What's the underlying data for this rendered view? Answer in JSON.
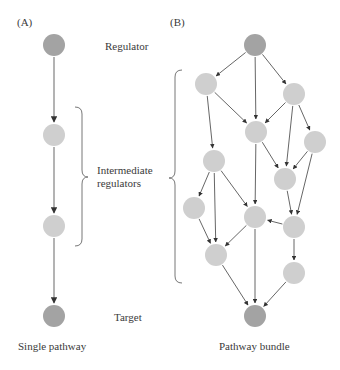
{
  "colors": {
    "endpoint_node": "#a3a3a3",
    "intermediate_node": "#cfcfcf",
    "edge": "#555555",
    "bracket": "#777777",
    "text": "#3a3a3a"
  },
  "panel_a": {
    "label": "(A)",
    "caption": "Single pathway",
    "labels": {
      "regulator": "Regulator",
      "intermediate_line1": "Intermediate",
      "intermediate_line2": "regulators",
      "target": "Target"
    },
    "nodes": [
      {
        "id": "regulator",
        "type": "endpoint",
        "x": 54,
        "y": 45
      },
      {
        "id": "int1",
        "type": "intermediate",
        "x": 54,
        "y": 135
      },
      {
        "id": "int2",
        "type": "intermediate",
        "x": 54,
        "y": 226
      },
      {
        "id": "target",
        "type": "endpoint",
        "x": 54,
        "y": 316
      }
    ],
    "edges": [
      [
        "regulator",
        "int1"
      ],
      [
        "int1",
        "int2"
      ],
      [
        "int2",
        "target"
      ]
    ]
  },
  "panel_b": {
    "label": "(B)",
    "caption": "Pathway bundle",
    "nodes": [
      {
        "id": "top",
        "type": "endpoint",
        "x": 255,
        "y": 45
      },
      {
        "id": "L1",
        "type": "intermediate",
        "x": 206,
        "y": 84
      },
      {
        "id": "R1",
        "type": "intermediate",
        "x": 294,
        "y": 94
      },
      {
        "id": "M1",
        "type": "intermediate",
        "x": 256,
        "y": 132
      },
      {
        "id": "R2",
        "type": "intermediate",
        "x": 315,
        "y": 142
      },
      {
        "id": "L2",
        "type": "intermediate",
        "x": 214,
        "y": 161
      },
      {
        "id": "MR",
        "type": "intermediate",
        "x": 285,
        "y": 179
      },
      {
        "id": "LL",
        "type": "intermediate",
        "x": 194,
        "y": 208
      },
      {
        "id": "M2",
        "type": "intermediate",
        "x": 255,
        "y": 217
      },
      {
        "id": "R3",
        "type": "intermediate",
        "x": 294,
        "y": 227
      },
      {
        "id": "L3",
        "type": "intermediate",
        "x": 216,
        "y": 255
      },
      {
        "id": "R4",
        "type": "intermediate",
        "x": 294,
        "y": 273
      },
      {
        "id": "target",
        "type": "endpoint",
        "x": 255,
        "y": 316
      }
    ],
    "edges": [
      [
        "top",
        "L1"
      ],
      [
        "top",
        "M1"
      ],
      [
        "top",
        "R1"
      ],
      [
        "L1",
        "L2"
      ],
      [
        "L1",
        "M1"
      ],
      [
        "R1",
        "M1"
      ],
      [
        "R1",
        "MR"
      ],
      [
        "R1",
        "R2"
      ],
      [
        "M1",
        "MR"
      ],
      [
        "M1",
        "M2"
      ],
      [
        "R2",
        "MR"
      ],
      [
        "R2",
        "R3"
      ],
      [
        "MR",
        "R3"
      ],
      [
        "L2",
        "LL"
      ],
      [
        "L2",
        "L3"
      ],
      [
        "L2",
        "M2"
      ],
      [
        "LL",
        "L3"
      ],
      [
        "M2",
        "L3"
      ],
      [
        "M2",
        "target"
      ],
      [
        "R3",
        "M2"
      ],
      [
        "R3",
        "R4"
      ],
      [
        "L3",
        "target"
      ],
      [
        "R4",
        "target"
      ]
    ]
  }
}
